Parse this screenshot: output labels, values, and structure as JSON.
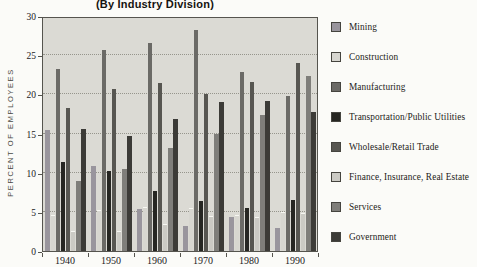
{
  "title": "(By Industry Division)",
  "y_axis": {
    "label": "PERCENT OF EMPLOYEES",
    "ticks": [
      0,
      5,
      10,
      15,
      20,
      25,
      30
    ],
    "max": 30
  },
  "x_axis": {
    "categories": [
      "1940",
      "1950",
      "1960",
      "1970",
      "1980",
      "1990"
    ]
  },
  "plot": {
    "background": "#dbdad4",
    "gridline_color": "#96958c"
  },
  "chart_data": {
    "type": "bar",
    "title": "(By Industry Division)",
    "xlabel": "",
    "ylabel": "PERCENT OF EMPLOYEES",
    "ylim": [
      0,
      30
    ],
    "grid": "dotted horizontal lines every 5 units",
    "legend_position": "right",
    "categories": [
      "1940",
      "1950",
      "1960",
      "1970",
      "1980",
      "1990"
    ],
    "series": [
      {
        "name": "Mining",
        "color": "#99959d",
        "values": [
          15.5,
          10.9,
          5.4,
          3.2,
          4.3,
          3.0
        ]
      },
      {
        "name": "Construction",
        "color": "#d7d6d0",
        "values": [
          4.6,
          5.2,
          5.6,
          5.5,
          4.6,
          5.0
        ]
      },
      {
        "name": "Manufacturing",
        "color": "#6b6a66",
        "values": [
          23.2,
          25.7,
          26.5,
          28.2,
          22.8,
          19.8
        ]
      },
      {
        "name": "Transportation/Public Utilities",
        "color": "#262622",
        "values": [
          11.4,
          10.2,
          7.7,
          6.4,
          5.5,
          6.5
        ]
      },
      {
        "name": "Wholesale/Retail Trade",
        "color": "#575651",
        "values": [
          18.2,
          20.7,
          21.5,
          20.1,
          21.6,
          24.0
        ]
      },
      {
        "name": "Finance, Insurance, Real Estate",
        "color": "#cbcac4",
        "values": [
          2.5,
          2.6,
          3.5,
          4.5,
          4.3,
          4.9
        ]
      },
      {
        "name": "Services",
        "color": "#7f7e7a",
        "values": [
          9.0,
          10.5,
          13.1,
          14.9,
          17.4,
          22.3
        ]
      },
      {
        "name": "Government",
        "color": "#3c3b37",
        "values": [
          15.6,
          14.7,
          16.9,
          19.0,
          19.1,
          17.7
        ]
      }
    ]
  }
}
